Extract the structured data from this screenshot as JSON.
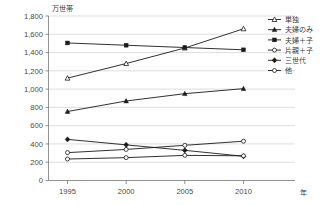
{
  "chart_data": {
    "type": "line",
    "title": "",
    "subtitle": "",
    "xlabel": "年",
    "ylabel": "万世帯",
    "unit_label": "万世帯",
    "x_unit_label": "年",
    "categories": [
      "1995",
      "2000",
      "2005",
      "2010"
    ],
    "x": [
      1995,
      2000,
      2005,
      2010
    ],
    "xlim": [
      1993.2,
      2011.8
    ],
    "ylim": [
      0,
      1800
    ],
    "y_ticks": [
      "0",
      "200",
      "400",
      "600",
      "800",
      "1,000",
      "1,200",
      "1,400",
      "1,600",
      "1,800"
    ],
    "y_tick_values": [
      0,
      200,
      400,
      600,
      800,
      1000,
      1200,
      1400,
      1600,
      1800
    ],
    "y_tick_step": 200,
    "grid": true,
    "grid_axis": "y",
    "legend_position": "right",
    "series": [
      {
        "name": "単独",
        "marker": "open-triangle",
        "values": [
          1120,
          1280,
          1450,
          1660
        ]
      },
      {
        "name": "夫婦のみ",
        "marker": "filled-triangle",
        "values": [
          755,
          870,
          950,
          1005
        ]
      },
      {
        "name": "夫婦＋子",
        "marker": "filled-square",
        "values": [
          1505,
          1480,
          1455,
          1430
        ]
      },
      {
        "name": "片親＋子",
        "marker": "open-circle",
        "values": [
          305,
          340,
          385,
          430
        ]
      },
      {
        "name": "三世代",
        "marker": "filled-diamond",
        "values": [
          450,
          390,
          330,
          265
        ]
      },
      {
        "name": "他",
        "marker": "open-circle",
        "values": [
          235,
          250,
          275,
          270
        ]
      }
    ]
  },
  "colors": {
    "ink": "#1a1a1a",
    "grid": "#c8c8c8",
    "axis": "#777777",
    "background": "#ffffff"
  }
}
